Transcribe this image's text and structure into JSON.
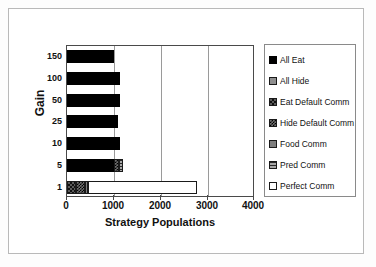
{
  "chart_data": {
    "type": "bar",
    "orientation": "horizontal",
    "stacked": true,
    "title": "",
    "xlabel": "Strategy Populations",
    "ylabel": "Gain",
    "xlim": [
      0,
      4000
    ],
    "xticks": [
      0,
      1000,
      2000,
      3000,
      4000
    ],
    "xtick_labels": [
      "0",
      "1000",
      "2000",
      "3000",
      "4000"
    ],
    "categories": [
      "150",
      "100",
      "50",
      "25",
      "10",
      "5",
      "1"
    ],
    "grid": "vertical",
    "legend_position": "right",
    "series": [
      {
        "name": "All Eat",
        "pattern": "solid-black",
        "values": [
          1020,
          1140,
          1140,
          1090,
          1140,
          1010,
          0
        ]
      },
      {
        "name": "All Hide",
        "pattern": "gray-solid",
        "values": [
          0,
          0,
          0,
          0,
          0,
          0,
          0
        ]
      },
      {
        "name": "Eat Default Comm",
        "pattern": "coarse-checker",
        "values": [
          0,
          0,
          0,
          0,
          0,
          0,
          200
        ]
      },
      {
        "name": "Hide Default Comm",
        "pattern": "fine-checker",
        "values": [
          0,
          0,
          0,
          0,
          0,
          100,
          180
        ]
      },
      {
        "name": "Food Comm",
        "pattern": "mid-gray",
        "values": [
          0,
          0,
          0,
          0,
          0,
          0,
          70
        ]
      },
      {
        "name": "Pred Comm",
        "pattern": "horizontal-lines",
        "values": [
          0,
          0,
          0,
          0,
          0,
          90,
          0
        ]
      },
      {
        "name": "Perfect Comm",
        "pattern": "white",
        "values": [
          0,
          0,
          0,
          0,
          0,
          0,
          2350
        ]
      }
    ],
    "row_totals": [
      1020,
      1140,
      1140,
      1090,
      1140,
      1200,
      2800
    ]
  },
  "axes": {
    "y_label": "Gain",
    "y_ticks": [
      "150",
      "100",
      "50",
      "25",
      "10",
      "5",
      "1"
    ],
    "x_label": "Strategy Populations",
    "x_ticks": [
      "0",
      "1000",
      "2000",
      "3000",
      "4000"
    ]
  },
  "legend": {
    "items": [
      {
        "label": "All Eat"
      },
      {
        "label": "All Hide"
      },
      {
        "label": "Eat Default Comm"
      },
      {
        "label": "Hide Default Comm"
      },
      {
        "label": "Food Comm"
      },
      {
        "label": "Pred Comm"
      },
      {
        "label": "Perfect Comm"
      }
    ]
  },
  "colors": {
    "axis": "#4a4a4a",
    "gridline": "#9a9a9a",
    "frame": "#b9b9b9",
    "text": "#111111",
    "bar_primary": "#000000",
    "bar_white": "#ffffff"
  }
}
